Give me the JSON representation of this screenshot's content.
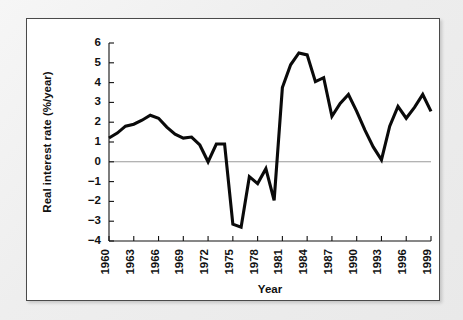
{
  "figure": {
    "frame_color": "#4a4a4a",
    "background_color": "#ffffff",
    "page_background_color": "#f2f2f2",
    "line_color": "#0a0a0a",
    "zero_line_color": "#9a9a9a"
  },
  "chart_data": {
    "type": "line",
    "title": "",
    "xlabel": "Year",
    "ylabel": "Real interest rate (%/year)",
    "xlim": [
      1960,
      1999
    ],
    "ylim": [
      -4,
      6
    ],
    "ytick_values": [
      6,
      5,
      4,
      3,
      2,
      1,
      0,
      -1,
      -2,
      -3,
      -4
    ],
    "ytick_labels": [
      "6",
      "5",
      "4",
      "3",
      "2",
      "1",
      "0",
      "−1",
      "−2",
      "−3",
      "−4"
    ],
    "xtick_values": [
      1960,
      1963,
      1966,
      1969,
      1972,
      1975,
      1978,
      1981,
      1984,
      1987,
      1990,
      1993,
      1996,
      1999
    ],
    "xtick_labels": [
      "1960",
      "1963",
      "1966",
      "1969",
      "1972",
      "1975",
      "1978",
      "1981",
      "1984",
      "1987",
      "1990",
      "1993",
      "1996",
      "1999"
    ],
    "xtick_minor_every": 1,
    "grid": false,
    "legend": false,
    "zero_reference_line": 0,
    "x": [
      1960,
      1961,
      1962,
      1963,
      1964,
      1965,
      1966,
      1967,
      1968,
      1969,
      1970,
      1971,
      1972,
      1973,
      1974,
      1975,
      1976,
      1977,
      1978,
      1979,
      1980,
      1981,
      1982,
      1983,
      1984,
      1985,
      1986,
      1987,
      1988,
      1989,
      1990,
      1991,
      1992,
      1993,
      1994,
      1995,
      1996,
      1997,
      1998,
      1999
    ],
    "values": [
      1.2,
      1.45,
      1.8,
      1.9,
      2.1,
      2.35,
      2.2,
      1.75,
      1.4,
      1.2,
      1.25,
      0.85,
      0.0,
      0.9,
      0.9,
      -3.15,
      -3.3,
      -0.75,
      -1.1,
      -0.35,
      -1.95,
      3.75,
      4.9,
      5.5,
      5.4,
      4.05,
      4.25,
      2.3,
      2.95,
      3.4,
      2.55,
      1.6,
      0.75,
      0.1,
      1.8,
      2.8,
      2.2,
      2.75,
      3.4,
      2.55
    ],
    "series": [
      {
        "name": "Real interest rate",
        "values": [
          1.2,
          1.45,
          1.8,
          1.9,
          2.1,
          2.35,
          2.2,
          1.75,
          1.4,
          1.2,
          1.25,
          0.85,
          0.0,
          0.9,
          0.9,
          -3.15,
          -3.3,
          -0.75,
          -1.1,
          -0.35,
          -1.95,
          3.75,
          4.9,
          5.5,
          5.4,
          4.05,
          4.25,
          2.3,
          2.95,
          3.4,
          2.55,
          1.6,
          0.75,
          0.1,
          1.8,
          2.8,
          2.2,
          2.75,
          3.4,
          2.55
        ]
      }
    ]
  }
}
